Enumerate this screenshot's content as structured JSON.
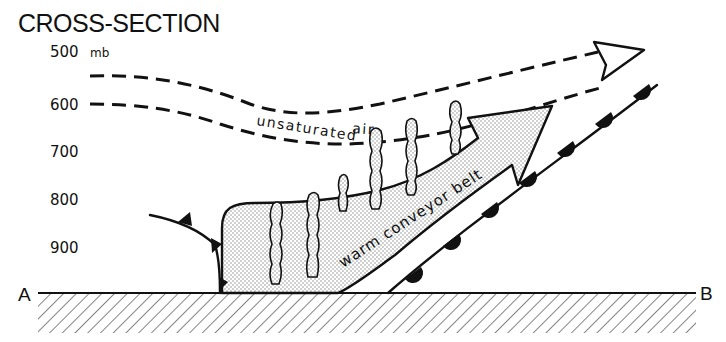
{
  "title": "CROSS-SECTION",
  "pressure_axis": {
    "unit": "mb",
    "levels": [
      {
        "label": "500",
        "y": 57
      },
      {
        "label": "600",
        "y": 105
      },
      {
        "label": "700",
        "y": 155
      },
      {
        "label": "800",
        "y": 202
      },
      {
        "label": "900",
        "y": 250
      }
    ]
  },
  "endpoints": {
    "left": "A",
    "right": "B"
  },
  "labels": {
    "unsaturated_air_1": "unsaturated",
    "unsaturated_air_2": "air",
    "warm_conveyor_belt": "warm conveyor belt"
  },
  "features": {
    "cold_front": "cold-front-symbol",
    "warm_front": "warm-front-symbol",
    "ground": "hatched-surface"
  },
  "colors": {
    "ink": "#111111",
    "background": "#ffffff",
    "stipple": "#9a9a9a"
  }
}
